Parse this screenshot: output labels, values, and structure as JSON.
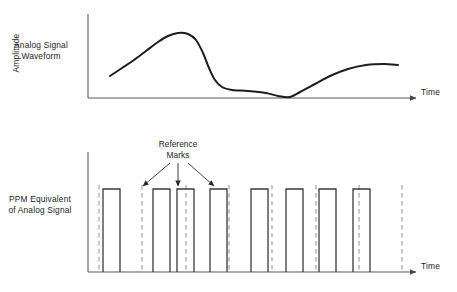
{
  "figure": {
    "background_color": "#ffffff",
    "ink_color": "#1d1d1d",
    "axis_color": "#5a5a5a",
    "dashed_color": "#9a9a9a"
  },
  "panels": {
    "analog": {
      "side_label": "Analog Signal\nWaveform",
      "y_axis_label": "Amplitude",
      "x_axis_label": "Time",
      "axis": {
        "x0": 88,
        "y_top": 14,
        "y_base": 98,
        "x_end": 420
      }
    },
    "ppm": {
      "side_label": "PPM Equivalent\nof Analog Signal",
      "x_axis_label": "Time",
      "annotation": "Reference\nMarks",
      "axis": {
        "x0": 88,
        "y_top": 152,
        "y_base": 272,
        "x_end": 420
      }
    }
  },
  "chart_data": [
    {
      "type": "line",
      "title": "Analog Signal Waveform",
      "xlabel": "Time",
      "ylabel": "Amplitude",
      "grid": false,
      "legend": "none",
      "xlim": [
        88,
        420
      ],
      "ylim": [
        0,
        84
      ],
      "points": [
        [
          110,
          22
        ],
        [
          122,
          30
        ],
        [
          134,
          38
        ],
        [
          146,
          47
        ],
        [
          158,
          56
        ],
        [
          168,
          62
        ],
        [
          178,
          65
        ],
        [
          188,
          64
        ],
        [
          196,
          58
        ],
        [
          203,
          45
        ],
        [
          209,
          30
        ],
        [
          215,
          18
        ],
        [
          222,
          11
        ],
        [
          232,
          8
        ],
        [
          248,
          7
        ],
        [
          266,
          5
        ],
        [
          278,
          2
        ],
        [
          290,
          1
        ],
        [
          300,
          6
        ],
        [
          315,
          14
        ],
        [
          330,
          22
        ],
        [
          348,
          29
        ],
        [
          366,
          33
        ],
        [
          384,
          34
        ],
        [
          398,
          33
        ]
      ]
    },
    {
      "type": "bar",
      "title": "PPM Equivalent of Analog Signal",
      "xlabel": "Time",
      "ylabel": "",
      "grid": false,
      "legend": "none",
      "xlim": [
        88,
        420
      ],
      "ylim": [
        0,
        120
      ],
      "note": "Rectangular PPM pulses; position within each interval encodes analog amplitude.",
      "pulse_height": 83,
      "pulses": [
        {
          "index": 1,
          "left": 103,
          "width": 17
        },
        {
          "index": 2,
          "left": 153,
          "width": 17
        },
        {
          "index": 3,
          "left": 177,
          "width": 17
        },
        {
          "index": 4,
          "left": 210,
          "width": 17
        },
        {
          "index": 5,
          "left": 251,
          "width": 17
        },
        {
          "index": 6,
          "left": 286,
          "width": 17
        },
        {
          "index": 7,
          "left": 319,
          "width": 17
        },
        {
          "index": 8,
          "left": 353,
          "width": 17
        }
      ],
      "reference_marks": [
        {
          "index": 1,
          "x": 99
        },
        {
          "index": 2,
          "x": 142
        },
        {
          "index": 3,
          "x": 186
        },
        {
          "index": 4,
          "x": 229
        },
        {
          "index": 5,
          "x": 272
        },
        {
          "index": 6,
          "x": 316
        },
        {
          "index": 7,
          "x": 359
        },
        {
          "index": 8,
          "x": 402
        }
      ],
      "annotation": {
        "text": "Reference\nMarks",
        "label_x": 178,
        "label_y": 150,
        "arrows": [
          {
            "to_x": 143,
            "to_y": 186,
            "from_x": 170,
            "from_y": 163
          },
          {
            "to_x": 178,
            "to_y": 186,
            "from_x": 178,
            "from_y": 163
          },
          {
            "to_x": 214,
            "to_y": 186,
            "from_x": 188,
            "from_y": 163
          }
        ]
      }
    }
  ]
}
